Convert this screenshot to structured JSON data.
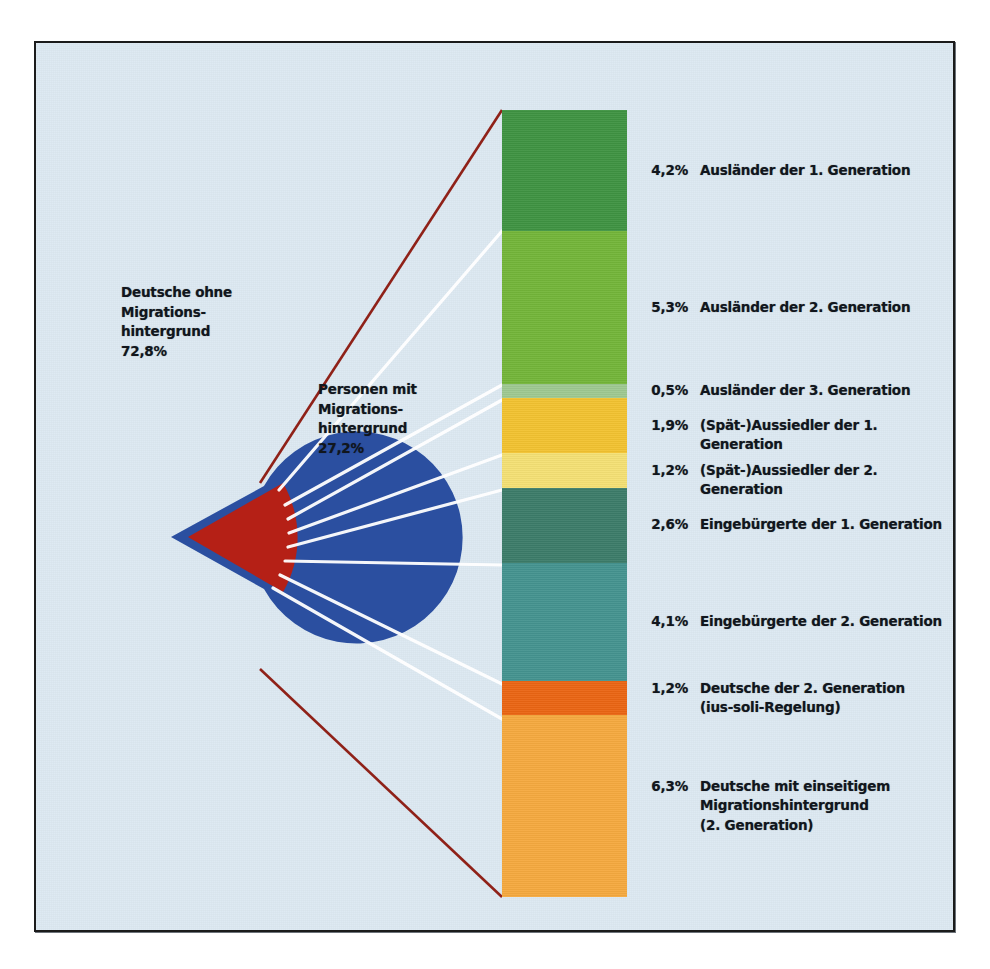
{
  "figure": {
    "background_color": "#dce8f1",
    "frame_color": "#1b1b1b"
  },
  "pie": {
    "slices": [
      {
        "name": "deutsche-ohne-migrationshintergrund",
        "label": "Deutsche ohne\nMigrations-\nhintergrund\n72,8%",
        "label_text": "Deutsche ohne Migrationshintergrund",
        "value": 72.8,
        "value_label": "72,8%",
        "color": "#2b4fa0",
        "exploded": false
      },
      {
        "name": "personen-mit-migrationshintergrund",
        "label": "Personen mit\nMigrations-\nhintergrund\n27,2%",
        "label_text": "Personen mit Migrationshintergrund",
        "value": 27.2,
        "value_label": "27,2%",
        "color": "#b52016",
        "exploded": true
      }
    ]
  },
  "chart_data": {
    "type": "pie",
    "title": "",
    "subtitle": "",
    "xlabel": "",
    "ylabel": "",
    "legend_position": "right",
    "grid": false,
    "pie": {
      "categories": [
        "Deutsche ohne Migrationshintergrund",
        "Personen mit Migrationshintergrund"
      ],
      "values": [
        72.8,
        27.2
      ],
      "value_labels": [
        "72,8%",
        "27,2%"
      ],
      "colors": [
        "#2b4fa0",
        "#b52016"
      ],
      "exploded_index": 1
    },
    "breakout": {
      "type": "bar",
      "orientation": "vertical-stacked",
      "parent_category": "Personen mit Migrationshintergrund",
      "parent_total": 27.2,
      "categories": [
        "Ausländer der 1. Generation",
        "Ausländer der 2. Generation",
        "Ausländer der 3. Generation",
        "(Spät-)Aussiedler der 1. Generation",
        "(Spät-)Aussiedler der 2. Generation",
        "Eingebürgerte der 1. Generation",
        "Eingebürgerte der 2. Generation",
        "Deutsche der 2. Generation (ius-soli-Regelung)",
        "Deutsche mit einseitigem Migrationshintergrund (2. Generation)"
      ],
      "values": [
        4.2,
        5.3,
        0.5,
        1.9,
        1.2,
        2.6,
        4.1,
        1.2,
        6.3
      ],
      "value_labels": [
        "4,2%",
        "5,3%",
        "0,5%",
        "1,9%",
        "1,2%",
        "2,6%",
        "4,1%",
        "1,2%",
        "6,3%"
      ],
      "colors": [
        "#3f9342",
        "#73b539",
        "#9ec891",
        "#f2c230",
        "#f4e074",
        "#3c7c69",
        "#44938f",
        "#ea6513",
        "#f5a93f"
      ],
      "ylim": [
        0,
        27.2
      ]
    }
  },
  "bar_segments": [
    {
      "name": "auslaender-1-generation",
      "pct": "4,2%",
      "label": "Ausländer der 1. Generation",
      "value": 4.2,
      "color": "#3f9342"
    },
    {
      "name": "auslaender-2-generation",
      "pct": "5,3%",
      "label": "Ausländer der 2. Generation",
      "value": 5.3,
      "color": "#73b539"
    },
    {
      "name": "auslaender-3-generation",
      "pct": "0,5%",
      "label": "Ausländer der 3. Generation",
      "value": 0.5,
      "color": "#9ec891"
    },
    {
      "name": "spaetaussiedler-1-generation",
      "pct": "1,9%",
      "label": "(Spät-)Aussiedler der 1. Generation",
      "value": 1.9,
      "color": "#f2c230"
    },
    {
      "name": "spaetaussiedler-2-generation",
      "pct": "1,2%",
      "label": "(Spät-)Aussiedler der 2. Generation",
      "value": 1.2,
      "color": "#f4e074"
    },
    {
      "name": "eingebuergerte-1-generation",
      "pct": "2,6%",
      "label": "Eingebürgerte der 1. Generation",
      "value": 2.6,
      "color": "#3c7c69"
    },
    {
      "name": "eingebuergerte-2-generation",
      "pct": "4,1%",
      "label": "Eingebürgerte der 2. Generation",
      "value": 4.1,
      "color": "#44938f"
    },
    {
      "name": "deutsche-2-generation-ius-soli",
      "pct": "1,2%",
      "label": "Deutsche der 2. Generation\n(ius-soli-Regelung)",
      "value": 1.2,
      "color": "#ea6513"
    },
    {
      "name": "deutsche-einseitiger-migrationshintergrund",
      "pct": "6,3%",
      "label": "Deutsche mit einseitigem\nMigrationshintergrund\n(2. Generation)",
      "value": 6.3,
      "color": "#f5a93f"
    }
  ]
}
